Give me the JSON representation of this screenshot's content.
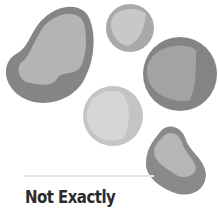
{
  "card": {
    "verdict": "Not Exactly"
  },
  "illustration": {
    "description": "five grey pebble-like blobs",
    "colors": {
      "dark_rim": "#7a7a7a",
      "mid": "#9a9a9a",
      "light": "#bdbdbd",
      "lightest": "#d2d2d2"
    }
  }
}
